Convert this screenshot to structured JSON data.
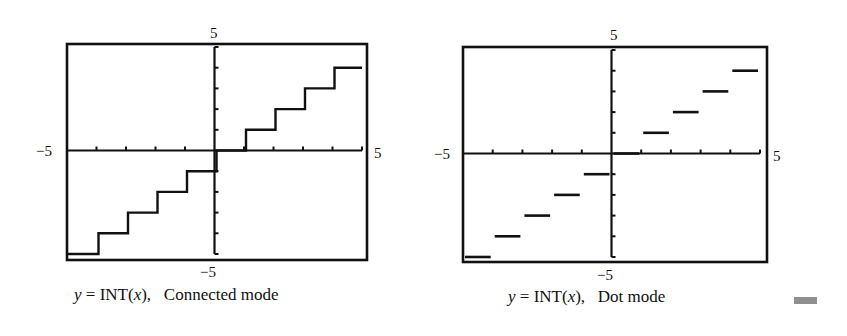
{
  "colors": {
    "ink": "#111111",
    "background": "#ffffff",
    "marker": "#8f8f8f"
  },
  "chart_data": [
    {
      "type": "line",
      "title": "y = INT(x), Connected mode",
      "function": "y = INT(x)",
      "mode": "Connected",
      "xlim": [
        -5,
        5
      ],
      "ylim": [
        -5,
        5
      ],
      "xtick_step": 1,
      "ytick_step": 1,
      "axis_labels": {
        "xmin": "−5",
        "xmax": "5",
        "ymin": "−5",
        "ymax": "5"
      },
      "steps": [
        {
          "x0": -5,
          "x1": -4,
          "y": -5
        },
        {
          "x0": -4,
          "x1": -3,
          "y": -4
        },
        {
          "x0": -3,
          "x1": -2,
          "y": -3
        },
        {
          "x0": -2,
          "x1": -1,
          "y": -2
        },
        {
          "x0": -1,
          "x1": 0,
          "y": -1
        },
        {
          "x0": 0,
          "x1": 1,
          "y": 0
        },
        {
          "x0": 1,
          "x1": 2,
          "y": 1
        },
        {
          "x0": 2,
          "x1": 3,
          "y": 2
        },
        {
          "x0": 3,
          "x1": 4,
          "y": 3
        },
        {
          "x0": 4,
          "x1": 5,
          "y": 4
        }
      ]
    },
    {
      "type": "scatter",
      "title": "y = INT(x), Dot mode",
      "function": "y = INT(x)",
      "mode": "Dot",
      "xlim": [
        -5,
        5
      ],
      "ylim": [
        -5,
        5
      ],
      "xtick_step": 1,
      "ytick_step": 1,
      "axis_labels": {
        "xmin": "−5",
        "xmax": "5",
        "ymin": "−5",
        "ymax": "5"
      },
      "steps": [
        {
          "x0": -5,
          "x1": -4,
          "y": -5
        },
        {
          "x0": -4,
          "x1": -3,
          "y": -4
        },
        {
          "x0": -3,
          "x1": -2,
          "y": -3
        },
        {
          "x0": -2,
          "x1": -1,
          "y": -2
        },
        {
          "x0": -1,
          "x1": 0,
          "y": -1
        },
        {
          "x0": 0,
          "x1": 1,
          "y": 0
        },
        {
          "x0": 1,
          "x1": 2,
          "y": 1
        },
        {
          "x0": 2,
          "x1": 3,
          "y": 2
        },
        {
          "x0": 3,
          "x1": 4,
          "y": 3
        },
        {
          "x0": 4,
          "x1": 5,
          "y": 4
        }
      ]
    }
  ],
  "captions": {
    "left": {
      "prefix": "y",
      "mid": " = INT(",
      "var": "x",
      "suffix": "),   Connected mode"
    },
    "right": {
      "prefix": "y",
      "mid": " = INT(",
      "var": "x",
      "suffix": "),   Dot mode"
    }
  }
}
